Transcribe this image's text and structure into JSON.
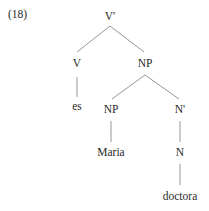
{
  "example_number": "(18)",
  "tree": {
    "root": {
      "label": "V'",
      "x": 110,
      "y": 17
    },
    "v": {
      "label": "V",
      "x": 77,
      "y": 64
    },
    "np_top": {
      "label": "NP",
      "x": 145,
      "y": 64
    },
    "es": {
      "label": "es",
      "x": 77,
      "y": 107
    },
    "np_inner": {
      "label": "NP",
      "x": 111,
      "y": 110
    },
    "n_bar": {
      "label": "N'",
      "x": 180,
      "y": 110
    },
    "maria": {
      "label": "Maria",
      "x": 111,
      "y": 153
    },
    "n": {
      "label": "N",
      "x": 180,
      "y": 153
    },
    "doctora": {
      "label": "doctora",
      "x": 180,
      "y": 197
    }
  },
  "edges": [
    {
      "from": "root",
      "to": "v"
    },
    {
      "from": "root",
      "to": "np_top"
    },
    {
      "from": "v",
      "to": "es"
    },
    {
      "from": "np_top",
      "to": "np_inner"
    },
    {
      "from": "np_top",
      "to": "n_bar"
    },
    {
      "from": "np_inner",
      "to": "maria"
    },
    {
      "from": "n_bar",
      "to": "n"
    },
    {
      "from": "n",
      "to": "doctora"
    }
  ],
  "colors": {
    "text": "#2a2a2a",
    "edge": "#8a8a8a",
    "background": "#ffffff"
  }
}
